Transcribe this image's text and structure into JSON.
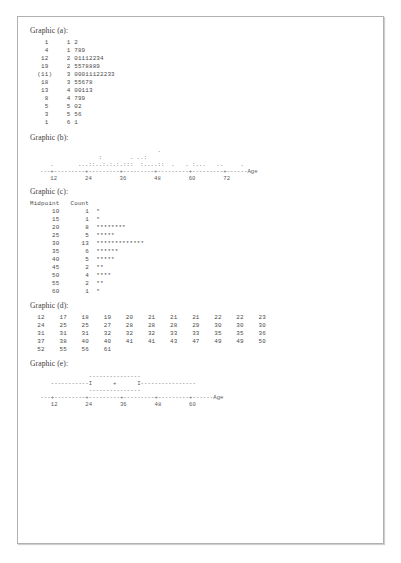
{
  "page": {
    "background_color": "#c9c9c9",
    "sheet_color": "#ffffff",
    "border_color": "#b0b0b0"
  },
  "graphic_a": {
    "label": "Graphic (a):",
    "type": "stem-and-leaf",
    "rows": [
      {
        "depth": "1",
        "stem": "1",
        "leaves": "2"
      },
      {
        "depth": "4",
        "stem": "1",
        "leaves": "789"
      },
      {
        "depth": "12",
        "stem": "2",
        "leaves": "01112234"
      },
      {
        "depth": "19",
        "stem": "2",
        "leaves": "5578889"
      },
      {
        "depth": "(11)",
        "stem": "3",
        "leaves": "00011122233"
      },
      {
        "depth": "18",
        "stem": "3",
        "leaves": "55678"
      },
      {
        "depth": "13",
        "stem": "4",
        "leaves": "00113"
      },
      {
        "depth": "8",
        "stem": "4",
        "leaves": "799"
      },
      {
        "depth": "5",
        "stem": "5",
        "leaves": "02"
      },
      {
        "depth": "3",
        "stem": "5",
        "leaves": "56"
      },
      {
        "depth": "1",
        "stem": "6",
        "leaves": "1"
      }
    ],
    "text": "    1     1 2\n    4     1 789\n   12     2 01112234\n   19     2 5578889\n  (11)    3 00011122233\n   18     3 55678\n   13     4 00113\n    8     4 799\n    5     5 02\n    3     5 56\n    1     6 1"
  },
  "graphic_b": {
    "label": "Graphic (b):",
    "type": "dotplot",
    "axis_variable": "Age",
    "tick_labels": [
      "12",
      "24",
      "36",
      "48",
      "60",
      "72"
    ],
    "dot_rows": [
      "                                  .",
      "                 :        . ..:",
      "   .       ...::..:.:.:.:::  :....::  .   . :...   ..     .",
      "---+---------+---------+---------+---------+---------+------Age",
      "   12        24        36        48        60        72"
    ],
    "text": "                                  .\n                 :        . ..:\n   .       ...::..:.:.:.:::  :....::  .   . :...   ..     .\n---+---------+---------+---------+---------+---------+------Age\n   12        24        36        48        60        72"
  },
  "graphic_c": {
    "label": "Graphic (c):",
    "type": "histogram",
    "header_midpoint": "Midpoint",
    "header_count": "Count",
    "rows": [
      {
        "midpoint": "10",
        "count": "1",
        "bar": "*"
      },
      {
        "midpoint": "15",
        "count": "1",
        "bar": "*"
      },
      {
        "midpoint": "20",
        "count": "8",
        "bar": "********"
      },
      {
        "midpoint": "25",
        "count": "5",
        "bar": "*****"
      },
      {
        "midpoint": "30",
        "count": "13",
        "bar": "*************"
      },
      {
        "midpoint": "35",
        "count": "6",
        "bar": "******"
      },
      {
        "midpoint": "40",
        "count": "5",
        "bar": "*****"
      },
      {
        "midpoint": "45",
        "count": "2",
        "bar": "**"
      },
      {
        "midpoint": "50",
        "count": "4",
        "bar": "****"
      },
      {
        "midpoint": "55",
        "count": "2",
        "bar": "**"
      },
      {
        "midpoint": "60",
        "count": "1",
        "bar": "*"
      }
    ],
    "text": "Midpoint   Count\n      10       1  *\n      15       1  *\n      20       8  ********\n      25       5  *****\n      30      13  *************\n      35       6  ******\n      40       5  *****\n      45       2  **\n      50       4  ****\n      55       2  **\n      60       1  *"
  },
  "graphic_d": {
    "label": "Graphic (d):",
    "type": "sorted-data-table",
    "rows": [
      [
        "12",
        "17",
        "18",
        "19",
        "20",
        "21",
        "21",
        "21",
        "22",
        "22",
        "23"
      ],
      [
        "24",
        "25",
        "25",
        "27",
        "28",
        "28",
        "28",
        "29",
        "30",
        "30",
        "30"
      ],
      [
        "31",
        "31",
        "31",
        "32",
        "32",
        "32",
        "33",
        "33",
        "35",
        "35",
        "36"
      ],
      [
        "37",
        "38",
        "40",
        "40",
        "41",
        "41",
        "43",
        "47",
        "49",
        "49",
        "50"
      ],
      [
        "52",
        "55",
        "56",
        "61"
      ]
    ],
    "text": "  12    17    18    19    20    21    21    21    22    22    23\n  24    25    25    27    28    28    28    29    30    30    30\n  31    31    31    32    32    32    33    33    35    35    36\n  37    38    40    40    41    41    43    47    49    49    50\n  52    55    56    61"
  },
  "graphic_e": {
    "label": "Graphic (e):",
    "type": "boxplot",
    "axis_variable": "Age",
    "tick_labels": [
      "12",
      "24",
      "36",
      "48",
      "60"
    ],
    "rows": [
      "                 ---------------",
      "      -----------I      +      I----------------",
      "                 ---------------",
      "   ---+---------+---------+---------+---------+------Age",
      "      12        24        36        48        60"
    ],
    "text": "                 ---------------\n      -----------I      +      I----------------\n                 ---------------\n   ---+---------+---------+---------+---------+------Age\n      12        24        36        48        60"
  },
  "chart_data": [
    {
      "type": "table",
      "title": "Graphic (a) — Stem-and-Leaf of Age",
      "xlabel": "",
      "ylabel": "",
      "columns": [
        "Depth",
        "Stem",
        "Leaves"
      ],
      "rows": [
        [
          "1",
          "1",
          "2"
        ],
        [
          "4",
          "1",
          "789"
        ],
        [
          "12",
          "2",
          "01112234"
        ],
        [
          "19",
          "2",
          "5578889"
        ],
        [
          "(11)",
          "3",
          "00011122233"
        ],
        [
          "18",
          "3",
          "55678"
        ],
        [
          "13",
          "4",
          "00113"
        ],
        [
          "8",
          "4",
          "799"
        ],
        [
          "5",
          "5",
          "02"
        ],
        [
          "3",
          "5",
          "56"
        ],
        [
          "1",
          "6",
          "1"
        ]
      ]
    },
    {
      "type": "scatter",
      "title": "Graphic (b) — Dotplot of Age",
      "xlabel": "Age",
      "ylabel": "",
      "xlim": [
        12,
        72
      ],
      "xticks": [
        12,
        24,
        36,
        48,
        60,
        72
      ],
      "grid": false,
      "legend": "none"
    },
    {
      "type": "bar",
      "title": "Graphic (c) — Histogram of Age",
      "xlabel": "Midpoint",
      "ylabel": "Count",
      "categories": [
        10,
        15,
        20,
        25,
        30,
        35,
        40,
        45,
        50,
        55,
        60
      ],
      "values": [
        1,
        1,
        8,
        5,
        13,
        6,
        5,
        2,
        4,
        2,
        1
      ],
      "ylim": [
        0,
        13
      ],
      "grid": false,
      "legend": "none"
    },
    {
      "type": "table",
      "title": "Graphic (d) — Sorted Ages",
      "xlabel": "",
      "ylabel": "",
      "values": [
        12,
        17,
        18,
        19,
        20,
        21,
        21,
        21,
        22,
        22,
        23,
        24,
        25,
        25,
        27,
        28,
        28,
        28,
        29,
        30,
        30,
        30,
        31,
        31,
        31,
        32,
        32,
        32,
        33,
        33,
        35,
        35,
        36,
        37,
        38,
        40,
        40,
        41,
        41,
        43,
        47,
        49,
        49,
        50,
        52,
        55,
        56,
        61
      ]
    },
    {
      "type": "bar",
      "title": "Graphic (e) — Boxplot of Age",
      "xlabel": "Age",
      "ylabel": "",
      "xlim": [
        12,
        60
      ],
      "xticks": [
        12,
        24,
        36,
        48,
        60
      ],
      "grid": false,
      "legend": "none"
    }
  ]
}
